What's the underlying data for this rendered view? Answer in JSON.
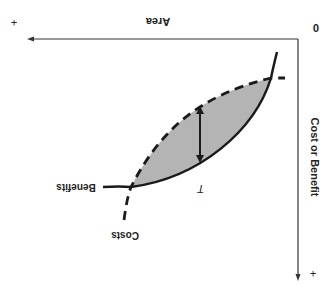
{
  "diagram": {
    "x_axis_label": "Area",
    "y_axis_label": "Cost or Benefit",
    "origin_label": "0",
    "x_axis_plus": "+",
    "y_axis_plus": "+",
    "benefits_label": "Benefits",
    "costs_label": "Costs",
    "optimum_label": "T",
    "colors": {
      "axis": "#333333",
      "curve": "#1a1a1a",
      "fill": "#b4b4b4",
      "text": "#222222"
    },
    "orientation": "rotated 180 degrees"
  }
}
